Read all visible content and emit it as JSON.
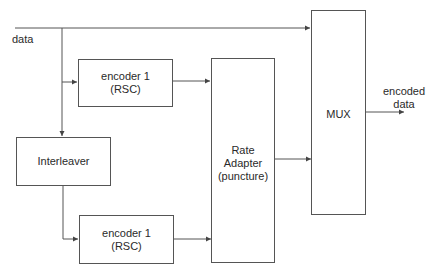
{
  "diagram": {
    "input_label": "data",
    "output_label_line1": "encoded",
    "output_label_line2": "data",
    "blocks": {
      "encoder_top": {
        "line1": "encoder 1",
        "line2": "(RSC)"
      },
      "encoder_bottom": {
        "line1": "encoder 1",
        "line2": "(RSC)"
      },
      "interleaver": {
        "line1": "Interleaver"
      },
      "rate_adapter": {
        "line1": "Rate",
        "line2": "Adapter",
        "line3": "(puncture)"
      },
      "mux": {
        "line1": "MUX"
      }
    },
    "colors": {
      "line": "#555555",
      "text": "#2a2a2a",
      "background": "#ffffff"
    }
  }
}
